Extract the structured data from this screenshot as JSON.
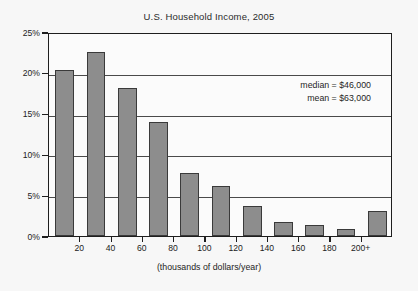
{
  "chart_data": {
    "type": "bar",
    "title": "U.S. Household Income, 2005",
    "xlabel": "(thousands of dollars/year)",
    "ylabel": "",
    "ylim": [
      0,
      25
    ],
    "xlim": [
      0,
      220
    ],
    "grid": true,
    "legend": "none",
    "y_ticks": [
      "0%",
      "5%",
      "10%",
      "15%",
      "20%",
      "25%"
    ],
    "y_tick_values": [
      0,
      5,
      10,
      15,
      20,
      25
    ],
    "x_ticks": [
      "20",
      "40",
      "60",
      "80",
      "100",
      "120",
      "140",
      "160",
      "180",
      "200+"
    ],
    "x_tick_values": [
      20,
      40,
      60,
      80,
      100,
      120,
      140,
      160,
      180,
      200
    ],
    "bin_width": 20,
    "categories": [
      "0-20",
      "20-40",
      "40-60",
      "60-80",
      "80-100",
      "100-120",
      "120-140",
      "140-160",
      "160-180",
      "180-200",
      "200+"
    ],
    "bin_centers": [
      10,
      30,
      50,
      70,
      90,
      110,
      130,
      150,
      170,
      190,
      210
    ],
    "values": [
      20.4,
      22.6,
      18.2,
      14.0,
      7.7,
      6.1,
      3.7,
      1.7,
      1.3,
      0.8,
      3.1
    ],
    "annotations": [
      "median = $46,000",
      "mean = $63,000"
    ],
    "colors": {
      "bar_fill": "#8d8d8d",
      "bar_stroke": "#3a3a3a",
      "grid": "#4a4a4a",
      "axis": "#1e1e1e",
      "background": "#f7f7f7",
      "plot_background": "#fbfbfb",
      "text": "#222222"
    }
  },
  "annotation": {
    "median_label": "median = $46,000",
    "mean_label": "mean = $63,000"
  }
}
